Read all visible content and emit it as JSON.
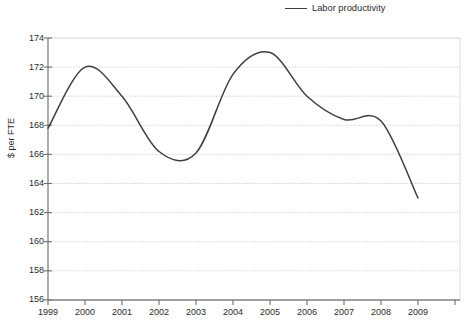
{
  "legend": {
    "entries": [
      {
        "label": "Labor productivity",
        "color": "#3f3f3f",
        "marker": "line-swatch"
      }
    ],
    "position": "top-right"
  },
  "axes": {
    "y_axis_title": "$ per FTE",
    "y_ticks": [
      "174",
      "172",
      "170",
      "168",
      "166",
      "164",
      "162",
      "160",
      "158",
      "156"
    ],
    "x_ticks": [
      "1999",
      "2000",
      "2001",
      "2002",
      "2003",
      "2004",
      "2005",
      "2006",
      "2007",
      "2008",
      "2009"
    ]
  },
  "chart_data": {
    "type": "line",
    "title": "",
    "xlabel": "",
    "ylabel": "$ per FTE",
    "categories": [
      "1999",
      "2000",
      "2001",
      "2002",
      "2003",
      "2004",
      "2005",
      "2006",
      "2007",
      "2008",
      "2009"
    ],
    "series": [
      {
        "name": "Labor productivity",
        "color": "#3f3f3f",
        "values": [
          167.8,
          172.0,
          170.0,
          166.2,
          166.1,
          171.5,
          173.0,
          170.0,
          168.4,
          168.3,
          163.0
        ]
      }
    ],
    "ylim": [
      156,
      174
    ],
    "ytick_step": 2,
    "xlim": [
      "1999",
      "2009"
    ],
    "grid": true,
    "grid_axis": "y",
    "grid_style": "dotted",
    "legend_position": "top-right",
    "line_style": "smooth-spline",
    "markers": false
  }
}
